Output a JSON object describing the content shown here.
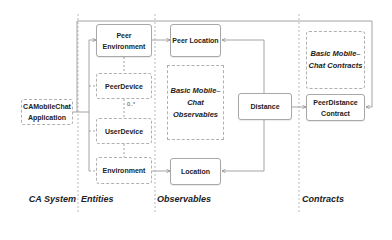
{
  "columns": [
    {
      "id": "ca-system",
      "label": "CA System"
    },
    {
      "id": "entities",
      "label": "Entities"
    },
    {
      "id": "observables",
      "label": "Observables"
    },
    {
      "id": "contracts",
      "label": "Contracts"
    }
  ],
  "nodes": {
    "application": {
      "label": "CAMobileChat Application",
      "style": "dashed"
    },
    "peer_environment": {
      "label": "Peer Environment",
      "style": "solid"
    },
    "peer_device": {
      "label": "PeerDevice",
      "style": "dashed"
    },
    "user_device": {
      "label": "UserDevice",
      "style": "dashed"
    },
    "environment": {
      "label": "Environment",
      "style": "dashed"
    },
    "peer_location": {
      "label": "Peer Location",
      "style": "solid"
    },
    "observables_group": {
      "label": "Basic Mobile–Chat Observables",
      "style": "dashed"
    },
    "location": {
      "label": "Location",
      "style": "solid"
    },
    "distance": {
      "label": "Distance",
      "style": "solid"
    },
    "contracts_group": {
      "label": "Basic Mobile–Chat Contracts",
      "style": "dashed"
    },
    "peer_distance_contract": {
      "label": "PeerDistance Contract",
      "style": "solid"
    }
  },
  "multiplicity": {
    "peer_device_user_device": "0..*"
  },
  "edges": [
    {
      "from": "application",
      "to": "peer_environment"
    },
    {
      "from": "application",
      "to": "peer_device"
    },
    {
      "from": "application",
      "to": "user_device"
    },
    {
      "from": "application",
      "to": "environment"
    },
    {
      "from": "application",
      "to": "peer_distance_contract"
    },
    {
      "from": "peer_environment",
      "to": "peer_location"
    },
    {
      "from": "environment",
      "to": "location"
    },
    {
      "from": "distance",
      "to": "peer_location"
    },
    {
      "from": "distance",
      "to": "location"
    },
    {
      "from": "distance",
      "to": "peer_distance_contract"
    }
  ],
  "colors": {
    "line": "#9a9a9a",
    "divider": "#a0a0a0",
    "text": "#222222"
  }
}
